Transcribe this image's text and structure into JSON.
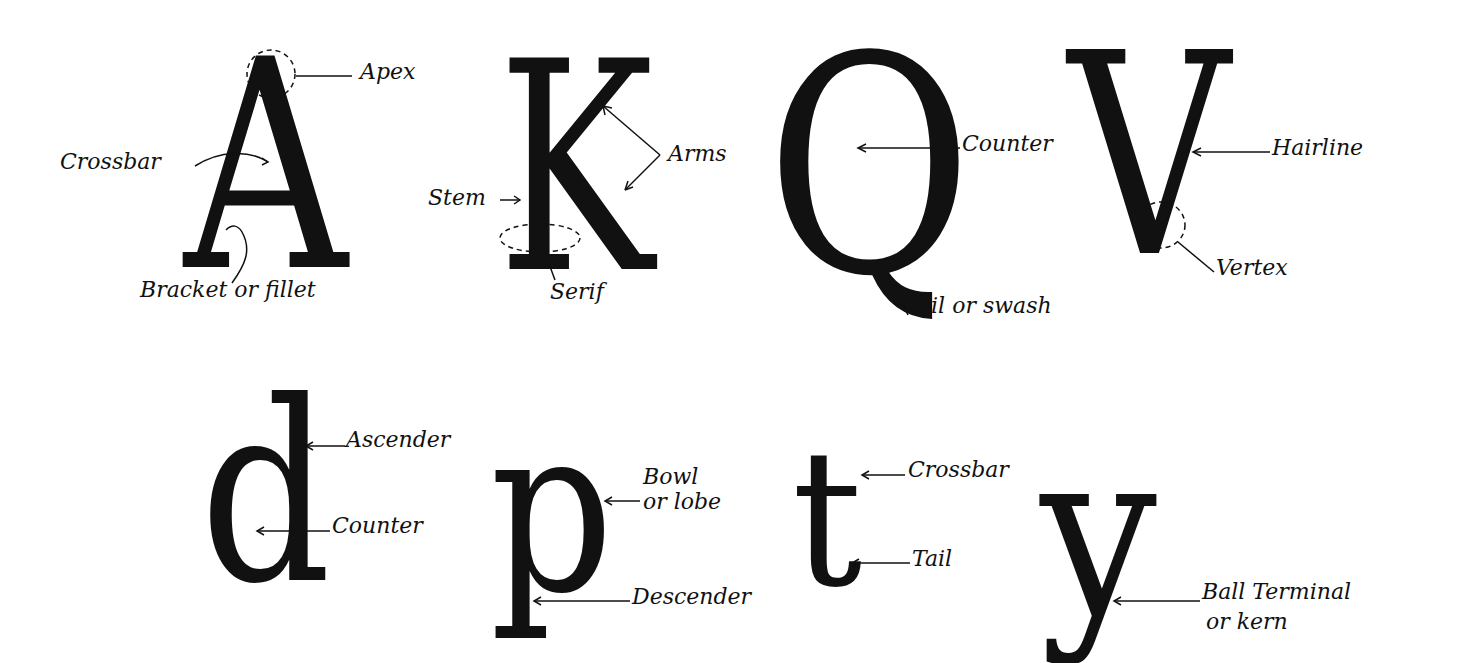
{
  "diagram": {
    "title": "",
    "colors": {
      "ink": "#111111",
      "background": "#ffffff"
    },
    "letters": [
      {
        "char": "A",
        "labels": [
          "Apex",
          "Crossbar",
          "Bracket or fillet"
        ]
      },
      {
        "char": "K",
        "labels": [
          "Arms",
          "Stem",
          "Serif"
        ]
      },
      {
        "char": "Q",
        "labels": [
          "Counter",
          "Tail or swash"
        ]
      },
      {
        "char": "V",
        "labels": [
          "Hairline",
          "Vertex"
        ]
      },
      {
        "char": "d",
        "labels": [
          "Ascender",
          "Counter"
        ]
      },
      {
        "char": "p",
        "labels": [
          "Bowl or lobe",
          "Descender"
        ]
      },
      {
        "char": "t",
        "labels": [
          "Crossbar",
          "Tail"
        ]
      },
      {
        "char": "y",
        "labels": [
          "Ball Terminal or kern"
        ]
      }
    ]
  },
  "glyphs": {
    "A": "A",
    "K": "K",
    "Q": "Q",
    "V": "V",
    "d": "d",
    "p": "p",
    "t": "t",
    "y": "y"
  },
  "labels": {
    "apex": "Apex",
    "crossbar_a": "Crossbar",
    "bracket": "Bracket or fillet",
    "arms": "Arms",
    "stem": "Stem",
    "serif": "Serif",
    "counter_q": "Counter",
    "tail_swash": "Tail or swash",
    "hairline": "Hairline",
    "vertex": "Vertex",
    "ascender": "Ascender",
    "counter_d": "Counter",
    "bowl_line1": "Bowl",
    "bowl_line2": "or lobe",
    "descender": "Descender",
    "crossbar_t": "Crossbar",
    "tail_t": "Tail",
    "ball_line1": "Ball Terminal",
    "ball_line2": "or kern"
  }
}
